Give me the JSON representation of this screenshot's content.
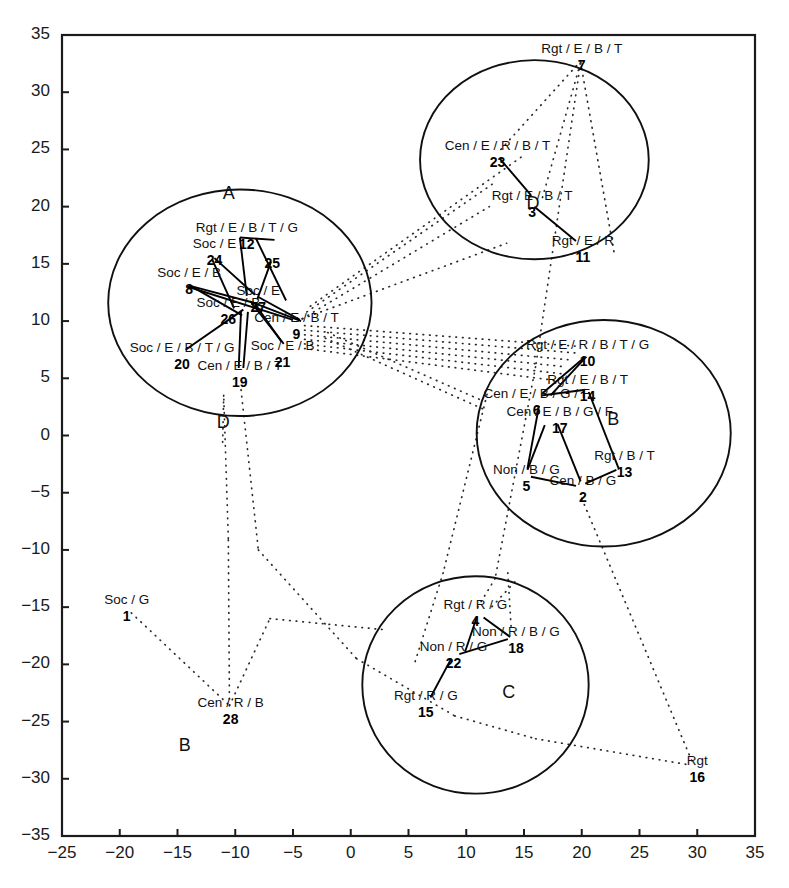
{
  "chart_data": {
    "type": "scatter",
    "title": "",
    "xlabel": "",
    "ylabel": "",
    "xlim": [
      -25,
      35
    ],
    "ylim": [
      -35,
      35
    ],
    "grid": false,
    "legend": "none",
    "xticks": [
      "-25",
      "-20",
      "-15",
      "-10",
      "-5",
      "0",
      "5",
      "10",
      "15",
      "20",
      "25",
      "30",
      "35"
    ],
    "yticks": [
      "35",
      "30",
      "25",
      "20",
      "15",
      "10",
      "5",
      "0",
      "-5",
      "-10",
      "-15",
      "-20",
      "-25",
      "-30",
      "-35"
    ],
    "clusters": [
      {
        "name": "A",
        "letter_x": -10.4,
        "letter_y": 21.0,
        "cx": -9.6,
        "cy": 11.6,
        "rx": 11.4,
        "ry": 9.9
      },
      {
        "name": "D",
        "letter_x": 15.9,
        "letter_y": 20.1,
        "cx": 15.9,
        "cy": 24.1,
        "rx": 9.9,
        "ry": 8.7
      },
      {
        "name": "B",
        "letter_x": 22.9,
        "letter_y": 1.3,
        "cx": 21.9,
        "cy": 0.2,
        "rx": 11.0,
        "ry": 9.9
      },
      {
        "name": "C",
        "letter_x": 13.8,
        "letter_y": -22.6,
        "cx": 10.8,
        "cy": -21.8,
        "rx": 9.8,
        "ry": 9.5
      },
      {
        "name": "D2",
        "letter": "D",
        "letter_x": -10.9,
        "letter_y": 1.0,
        "cx": null,
        "cy": null,
        "rx": 0,
        "ry": 0
      },
      {
        "name": "B2",
        "letter": "B",
        "letter_x": -14.2,
        "letter_y": -27.2,
        "cx": null,
        "cy": null,
        "rx": 0,
        "ry": 0
      }
    ],
    "points": [
      {
        "id": "1",
        "label": "Soc / G",
        "x": -19.4,
        "y": -15.0,
        "cluster": ""
      },
      {
        "id": "2",
        "label": "Cen / B / G",
        "x": 20.1,
        "y": -4.6,
        "cluster": "B"
      },
      {
        "id": "3",
        "label": "Rgt / E / B / T",
        "x": 15.7,
        "y": 20.3,
        "cluster": "D"
      },
      {
        "id": "4",
        "label": "Rgt / R / G",
        "x": 10.8,
        "y": -15.4,
        "cluster": "C"
      },
      {
        "id": "5",
        "label": "Non / B / G",
        "x": 15.2,
        "y": -3.6,
        "cluster": "B"
      },
      {
        "id": "6",
        "label": "Cen / E / B / G / F",
        "x": 16.1,
        "y": 3.0,
        "cluster": "B"
      },
      {
        "id": "7",
        "label": "Rgt / E / B / T",
        "x": 20.0,
        "y": 33.2,
        "cluster": ""
      },
      {
        "id": "8",
        "label": "Soc / E / B",
        "x": -14.0,
        "y": 13.6,
        "cluster": "A"
      },
      {
        "id": "9",
        "label": "Cen / E / B / T",
        "x": -4.7,
        "y": 9.7,
        "cluster": "A"
      },
      {
        "id": "10",
        "label": "Rgt / E / R / B / T / G",
        "x": 20.5,
        "y": 7.3,
        "cluster": "B"
      },
      {
        "id": "11",
        "label": "Rgt / E / R",
        "x": 20.1,
        "y": 16.4,
        "cluster": "D"
      },
      {
        "id": "12",
        "label": "Rgt / E / B / T / G",
        "x": -9.0,
        "y": 17.5,
        "cluster": "A"
      },
      {
        "id": "13",
        "label": "Rgt / B / T",
        "x": 23.7,
        "y": -2.4,
        "cluster": "B"
      },
      {
        "id": "14",
        "label": "Rgt / E / B / T",
        "x": 20.5,
        "y": 4.2,
        "cluster": "B"
      },
      {
        "id": "15",
        "label": "Rgt / R / G",
        "x": 6.5,
        "y": -23.4,
        "cluster": "C"
      },
      {
        "id": "16",
        "label": "Rgt",
        "x": 30.0,
        "y": -29.1,
        "cluster": ""
      },
      {
        "id": "17",
        "label": "Cen / E / B / G / F",
        "x": 18.1,
        "y": 1.4,
        "cluster": "B"
      },
      {
        "id": "18",
        "label": "Non / R / B / G",
        "x": 14.3,
        "y": -17.8,
        "cluster": "C"
      },
      {
        "id": "19",
        "label": "Cen / E / B / T",
        "x": -9.6,
        "y": 5.5,
        "cluster": "A"
      },
      {
        "id": "20",
        "label": "Soc / E / B / T / G",
        "x": -14.6,
        "y": 7.0,
        "cluster": "A"
      },
      {
        "id": "21",
        "label": "Soc / E / B",
        "x": -5.9,
        "y": 7.2,
        "cluster": "A"
      },
      {
        "id": "22",
        "label": "Non / R / G",
        "x": 8.9,
        "y": -19.1,
        "cluster": "C"
      },
      {
        "id": "23",
        "label": "Cen / E / R / B / T",
        "x": 12.7,
        "y": 24.7,
        "cluster": "D"
      },
      {
        "id": "24",
        "label": "Soc / E",
        "x": -11.8,
        "y": 16.1,
        "cluster": "A"
      },
      {
        "id": "25",
        "label": "",
        "x": -6.8,
        "y": 15.9,
        "cluster": "A"
      },
      {
        "id": "26",
        "label": "Soc / E / B",
        "x": -10.6,
        "y": 11.0,
        "cluster": "A"
      },
      {
        "id": "27",
        "label": "Soc / E",
        "x": -8.0,
        "y": 12.0,
        "cluster": "A"
      },
      {
        "id": "28",
        "label": "Cen / R / B",
        "x": -10.4,
        "y": -24.0,
        "cluster": ""
      }
    ],
    "solid_edges": [
      [
        [
          -9.6,
          17.3
        ],
        [
          -6.6,
          17.1
        ]
      ],
      [
        [
          -9.6,
          17.3
        ],
        [
          -9.0,
          12.2
        ]
      ],
      [
        [
          -8.2,
          17.2
        ],
        [
          -5.6,
          11.8
        ]
      ],
      [
        [
          -11.8,
          15.5
        ],
        [
          -8.3,
          12.3
        ]
      ],
      [
        [
          -12.0,
          15.4
        ],
        [
          -10.1,
          11.1
        ]
      ],
      [
        [
          -6.9,
          15.2
        ],
        [
          -8.1,
          11.9
        ]
      ],
      [
        [
          -14.0,
          13.1
        ],
        [
          -8.4,
          11.6
        ]
      ],
      [
        [
          -14.1,
          13.0
        ],
        [
          -5.0,
          10.1
        ]
      ],
      [
        [
          -13.9,
          13.1
        ],
        [
          -9.4,
          10.5
        ]
      ],
      [
        [
          -8.7,
          11.7
        ],
        [
          -4.3,
          10.0
        ]
      ],
      [
        [
          -8.6,
          11.6
        ],
        [
          -5.8,
          8.0
        ]
      ],
      [
        [
          -9.3,
          11.0
        ],
        [
          -14.3,
          7.5
        ]
      ],
      [
        [
          -9.5,
          10.9
        ],
        [
          -9.7,
          5.9
        ]
      ],
      [
        [
          -8.9,
          10.8
        ],
        [
          -9.3,
          5.9
        ]
      ],
      [
        [
          -8.3,
          11.5
        ],
        [
          -6.0,
          8.2
        ]
      ],
      [
        [
          -8.0,
          12.1
        ],
        [
          -4.4,
          10.1
        ]
      ],
      [
        [
          12.9,
          24.2
        ],
        [
          15.6,
          21.0
        ]
      ],
      [
        [
          15.9,
          20.0
        ],
        [
          19.5,
          17.0
        ]
      ],
      [
        [
          20.4,
          6.9
        ],
        [
          17.3,
          3.5
        ]
      ],
      [
        [
          20.2,
          6.8
        ],
        [
          16.6,
          3.7
        ]
      ],
      [
        [
          16.5,
          3.5
        ],
        [
          20.3,
          4.0
        ]
      ],
      [
        [
          16.3,
          2.6
        ],
        [
          15.3,
          -2.9
        ]
      ],
      [
        [
          17.9,
          1.0
        ],
        [
          19.9,
          -4.0
        ]
      ],
      [
        [
          16.8,
          0.9
        ],
        [
          15.3,
          -3.0
        ]
      ],
      [
        [
          20.6,
          3.8
        ],
        [
          23.2,
          -2.9
        ]
      ],
      [
        [
          23.0,
          -3.0
        ],
        [
          20.3,
          -4.2
        ]
      ],
      [
        [
          15.6,
          -3.6
        ],
        [
          19.5,
          -4.4
        ]
      ],
      [
        [
          10.9,
          -15.9
        ],
        [
          9.9,
          -18.9
        ]
      ],
      [
        [
          11.5,
          -15.9
        ],
        [
          13.8,
          -17.6
        ]
      ],
      [
        [
          13.6,
          -17.8
        ],
        [
          9.4,
          -19.1
        ]
      ],
      [
        [
          8.7,
          -19.5
        ],
        [
          6.9,
          -22.9
        ]
      ]
    ],
    "dotted_edges": [
      [
        [
          -19.0,
          -15.5
        ],
        [
          -10.5,
          -23.6
        ]
      ],
      [
        [
          -10.5,
          -23.6
        ],
        [
          -10.6,
          -9.0
        ]
      ],
      [
        [
          -10.5,
          -23.6
        ],
        [
          -7.0,
          -16.0
        ]
      ],
      [
        [
          -7.0,
          -16.0
        ],
        [
          3.2,
          -17.0
        ]
      ],
      [
        [
          -10.6,
          -9.0
        ],
        [
          -11.0,
          3.5
        ]
      ],
      [
        [
          -4.2,
          10.2
        ],
        [
          12.0,
          20.0
        ]
      ],
      [
        [
          -4.2,
          10.2
        ],
        [
          13.5,
          16.8
        ]
      ],
      [
        [
          -4.0,
          9.6
        ],
        [
          19.6,
          7.8
        ]
      ],
      [
        [
          -4.0,
          9.2
        ],
        [
          19.6,
          7.2
        ]
      ],
      [
        [
          -4.0,
          8.8
        ],
        [
          19.0,
          6.6
        ]
      ],
      [
        [
          -4.0,
          8.4
        ],
        [
          18.6,
          6.0
        ]
      ],
      [
        [
          -4.0,
          8.0
        ],
        [
          18.2,
          5.4
        ]
      ],
      [
        [
          -4.0,
          7.6
        ],
        [
          17.8,
          4.8
        ]
      ],
      [
        [
          -3.8,
          10.8
        ],
        [
          12.6,
          22.2
        ]
      ],
      [
        [
          -3.5,
          11.3
        ],
        [
          15.0,
          24.5
        ]
      ],
      [
        [
          13.0,
          25.0
        ],
        [
          19.8,
          32.6
        ]
      ],
      [
        [
          16.6,
          20.8
        ],
        [
          19.9,
          32.6
        ]
      ],
      [
        [
          19.9,
          32.6
        ],
        [
          22.8,
          16.0
        ]
      ],
      [
        [
          19.9,
          32.6
        ],
        [
          16.0,
          6.0
        ]
      ],
      [
        [
          16.0,
          6.0
        ],
        [
          12.5,
          -12.5
        ]
      ],
      [
        [
          12.5,
          -12.5
        ],
        [
          11.0,
          -15.0
        ]
      ],
      [
        [
          13.6,
          -12.0
        ],
        [
          13.9,
          -17.0
        ]
      ],
      [
        [
          20.0,
          -5.5
        ],
        [
          29.6,
          -28.6
        ]
      ],
      [
        [
          14.2,
          -12.8
        ],
        [
          12.0,
          -15.2
        ]
      ],
      [
        [
          -11.0,
          3.5
        ],
        [
          -11.1,
          -1.0
        ]
      ],
      [
        [
          -9.5,
          4.0
        ],
        [
          -8.0,
          -10.0
        ]
      ],
      [
        [
          -8.0,
          -10.0
        ],
        [
          0.5,
          -19.5
        ]
      ],
      [
        [
          0.5,
          -19.5
        ],
        [
          9.0,
          -24.5
        ]
      ],
      [
        [
          9.0,
          -24.5
        ],
        [
          16.0,
          -26.5
        ]
      ],
      [
        [
          16.0,
          -26.5
        ],
        [
          29.4,
          -28.8
        ]
      ],
      [
        [
          11.8,
          3.6
        ],
        [
          8.0,
          -12.0
        ]
      ],
      [
        [
          8.0,
          -12.0
        ],
        [
          5.5,
          -20.0
        ]
      ],
      [
        [
          -2.0,
          9.0
        ],
        [
          11.5,
          3.0
        ]
      ],
      [
        [
          -2.2,
          8.5
        ],
        [
          11.5,
          2.3
        ]
      ]
    ]
  }
}
